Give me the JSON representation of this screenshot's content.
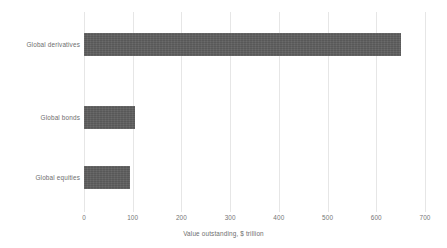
{
  "chart_data": {
    "type": "bar",
    "orientation": "horizontal",
    "title": "",
    "subtitle": "",
    "categories": [
      "Global derivatives",
      "Global bonds",
      "Global equities"
    ],
    "values": [
      650,
      105,
      95
    ],
    "series": [
      {
        "name": "Value outstanding",
        "values": [
          650,
          105,
          95
        ]
      }
    ],
    "xlabel": "Value outstanding, $ trillion",
    "ylabel": "",
    "xlim": [
      0,
      700
    ],
    "xticks": [
      0,
      100,
      200,
      300,
      400,
      500,
      600,
      700
    ],
    "xtick_labels": [
      "0",
      "100",
      "200",
      "300",
      "400",
      "500",
      "600",
      "700"
    ],
    "grid": "vertical-only",
    "legend": "none",
    "annotations": [],
    "colors": {
      "bar_fill": "#5e5e5e",
      "gridline": "#e6e6e6",
      "background": "#ffffff",
      "label_text": "#6e6e6e",
      "tick_text": "#757575"
    }
  }
}
